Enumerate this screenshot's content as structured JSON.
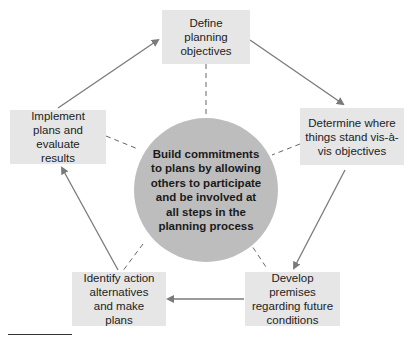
{
  "diagram": {
    "type": "cycle",
    "center": {
      "label": "Build commitments to plans by allowing others to participate and be involved at all steps in the planning process"
    },
    "steps": [
      {
        "id": "define",
        "label": "Define planning objectives"
      },
      {
        "id": "determine",
        "label": "Determine where things stand vis-à-vis objectives"
      },
      {
        "id": "develop",
        "label": "Develop premises regarding future conditions"
      },
      {
        "id": "identify",
        "label": "Identify action alternatives and make plans"
      },
      {
        "id": "implement",
        "label": "Implement plans and evaluate results"
      }
    ],
    "flow": [
      "define",
      "determine",
      "develop",
      "identify",
      "implement",
      "define"
    ],
    "colors": {
      "box_fill": "#e6e6e6",
      "circle_fill": "#bdbdbd",
      "arrow": "#7a7a7a",
      "dashed": "#666666"
    }
  }
}
